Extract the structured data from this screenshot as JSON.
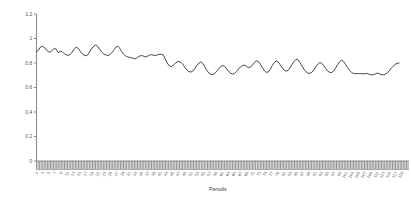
{
  "chart_data": {
    "type": "line",
    "title": "",
    "xlabel": "Periods",
    "ylabel": "",
    "ylim": [
      0,
      1.2
    ],
    "yticks": [
      0,
      0.2,
      0.4,
      0.6,
      0.8,
      1,
      1.2
    ],
    "ytick_labels": [
      "0",
      "0.2",
      "0.4",
      "0.6",
      "0.8",
      "1",
      "1.2"
    ],
    "grid": false,
    "legend": false,
    "legend_position": "none",
    "line_color": "#3a3a3a",
    "axis_color": "#8c8c8c",
    "series_name": "value",
    "categories": [
      "1",
      "2",
      "3",
      "4",
      "5",
      "6",
      "7",
      "8",
      "9",
      "10",
      "11",
      "12",
      "13",
      "14",
      "15",
      "16",
      "17",
      "18",
      "19",
      "20",
      "21",
      "22",
      "23",
      "24",
      "25",
      "26",
      "27",
      "28",
      "29",
      "30",
      "31",
      "32",
      "33",
      "34",
      "35",
      "36",
      "37",
      "38",
      "39",
      "40",
      "41",
      "42",
      "43",
      "44",
      "45",
      "46",
      "47",
      "48",
      "49",
      "50",
      "51",
      "52",
      "53",
      "54",
      "55",
      "56",
      "57",
      "58",
      "59",
      "60",
      "61",
      "62",
      "63",
      "64",
      "65",
      "66",
      "67",
      "68",
      "69",
      "70",
      "71",
      "72",
      "73",
      "74",
      "75",
      "76",
      "77",
      "78",
      "79",
      "80",
      "81",
      "82",
      "83",
      "84",
      "85",
      "86",
      "87",
      "88",
      "89",
      "90",
      "91",
      "92",
      "93",
      "94",
      "95",
      "96",
      "97",
      "98",
      "99",
      "100",
      "101",
      "102",
      "103",
      "104",
      "105",
      "106",
      "107",
      "108",
      "109",
      "110",
      "111",
      "112",
      "113",
      "114",
      "115",
      "116",
      "117",
      "118",
      "119",
      "120"
    ],
    "xtick_labels": [
      "1",
      "3",
      "5",
      "7",
      "9",
      "11",
      "13",
      "15",
      "17",
      "19",
      "21",
      "23",
      "25",
      "27",
      "29",
      "31",
      "33",
      "35",
      "37",
      "39",
      "41",
      "43",
      "45",
      "47",
      "49",
      "51",
      "53",
      "55",
      "57",
      "59",
      "61",
      "63",
      "65",
      "67",
      "69",
      "71",
      "73",
      "75",
      "77",
      "79",
      "81",
      "83",
      "85",
      "87",
      "89",
      "91",
      "93",
      "95",
      "97",
      "99",
      "101",
      "103",
      "105",
      "107",
      "109",
      "111",
      "113",
      "115",
      "117",
      "119"
    ],
    "values": [
      0.893,
      0.905,
      0.93,
      0.936,
      0.927,
      0.905,
      0.893,
      0.889,
      0.903,
      0.92,
      0.913,
      0.884,
      0.897,
      0.892,
      0.876,
      0.867,
      0.862,
      0.87,
      0.889,
      0.913,
      0.929,
      0.92,
      0.897,
      0.877,
      0.864,
      0.858,
      0.87,
      0.896,
      0.921,
      0.94,
      0.949,
      0.934,
      0.909,
      0.888,
      0.873,
      0.866,
      0.861,
      0.868,
      0.884,
      0.905,
      0.929,
      0.938,
      0.92,
      0.893,
      0.871,
      0.858,
      0.85,
      0.846,
      0.841,
      0.838,
      0.834,
      0.846,
      0.856,
      0.861,
      0.856,
      0.849,
      0.855,
      0.864,
      0.868,
      0.864,
      0.861,
      0.866,
      0.871,
      0.872,
      0.866,
      0.833,
      0.8,
      0.777,
      0.77,
      0.781,
      0.797,
      0.809,
      0.812,
      0.804,
      0.786,
      0.762,
      0.741,
      0.729,
      0.726,
      0.737,
      0.757,
      0.78,
      0.8,
      0.81,
      0.796,
      0.768,
      0.739,
      0.719,
      0.708,
      0.705,
      0.714,
      0.733,
      0.754,
      0.771,
      0.78,
      0.772,
      0.752,
      0.731,
      0.716,
      0.71,
      0.715,
      0.731,
      0.752,
      0.769,
      0.779,
      0.782,
      0.773,
      0.762,
      0.766,
      0.783,
      0.804,
      0.818,
      0.812,
      0.79,
      0.762,
      0.738,
      0.724,
      0.726,
      0.748,
      0.779
    ],
    "values_tail": [
      0.803,
      0.816,
      0.808,
      0.786,
      0.762,
      0.742,
      0.733,
      0.74,
      0.762,
      0.789,
      0.812,
      0.829,
      0.826,
      0.804,
      0.776,
      0.75,
      0.729,
      0.718,
      0.715,
      0.724,
      0.743,
      0.768,
      0.79,
      0.804,
      0.798,
      0.779,
      0.755,
      0.735,
      0.723,
      0.722,
      0.735,
      0.759,
      0.786,
      0.809,
      0.823,
      0.813,
      0.789,
      0.762,
      0.74,
      0.724,
      0.715,
      0.713,
      0.714,
      0.714,
      0.713,
      0.712,
      0.712,
      0.716,
      0.706,
      0.703,
      0.704,
      0.71,
      0.718,
      0.712,
      0.706,
      0.703,
      0.707,
      0.718,
      0.735,
      0.755,
      0.773,
      0.788,
      0.797,
      0.8
    ]
  },
  "axes": {
    "x_title": "Periods"
  }
}
